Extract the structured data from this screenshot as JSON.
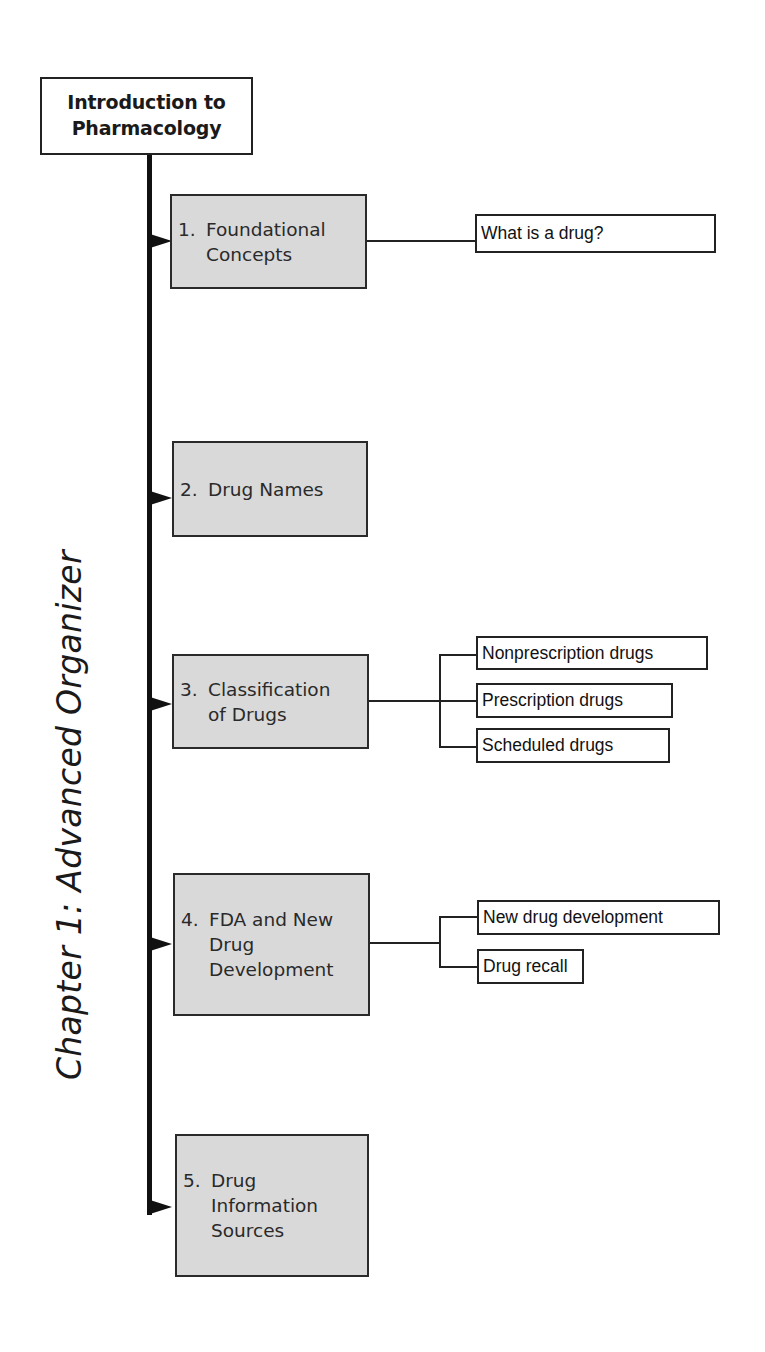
{
  "root": {
    "line1": "Introduction to",
    "line2": "Pharmacology"
  },
  "side_title": "Chapter 1: Advanced Organizer",
  "topics": [
    {
      "num": "1.",
      "lines": [
        "Foundational",
        "Concepts"
      ],
      "subtopics": [
        "What is a drug?"
      ]
    },
    {
      "num": "2.",
      "lines": [
        "Drug Names"
      ],
      "subtopics": []
    },
    {
      "num": "3.",
      "lines": [
        "Classification",
        "of Drugs"
      ],
      "subtopics": [
        "Nonprescription drugs",
        "Prescription drugs",
        "Scheduled drugs"
      ]
    },
    {
      "num": "4.",
      "lines": [
        "FDA and New",
        "Drug",
        "Development"
      ],
      "subtopics": [
        "New drug development",
        "Drug recall"
      ]
    },
    {
      "num": "5.",
      "lines": [
        "Drug",
        "Information",
        "Sources"
      ],
      "subtopics": []
    }
  ],
  "colors": {
    "topic_fill": "#d9d9d9",
    "line": "#111111",
    "subtopic_fill": "#ffffff"
  }
}
